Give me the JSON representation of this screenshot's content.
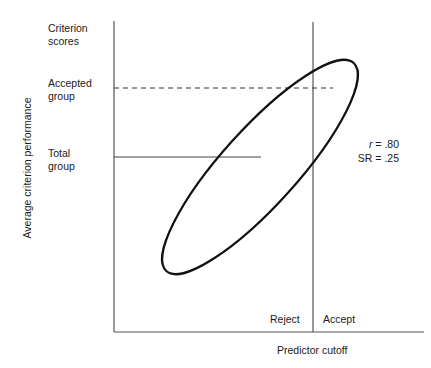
{
  "diagram": {
    "y_axis_label": "Average criterion performance",
    "x_axis_label": "Predictor cutoff",
    "row_labels": {
      "criterion_scores": [
        "Criterion",
        "scores"
      ],
      "accepted_group": [
        "Accepted",
        "group"
      ],
      "total_group": [
        "Total",
        "group"
      ]
    },
    "regions": {
      "reject": "Reject",
      "accept": "Accept"
    },
    "stats": {
      "r_symbol": "r",
      "r_value": " = .80",
      "sr": "SR = .25"
    },
    "colors": {
      "axis": "#555555",
      "ellipse": "#111111",
      "text": "#1a1a1a"
    }
  }
}
